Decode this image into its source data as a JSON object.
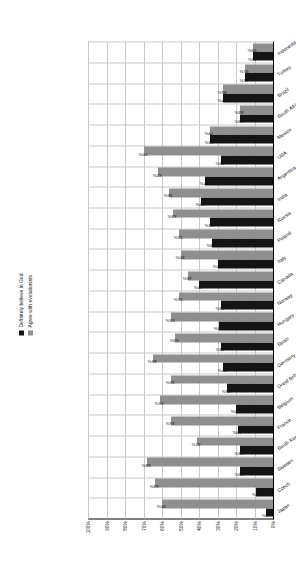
{
  "chart_data": {
    "type": "bar",
    "title": "",
    "xlabel": "",
    "ylabel": "",
    "ylim": [
      0,
      100
    ],
    "ytick_labels": [
      "100%",
      "90%",
      "80%",
      "70%",
      "60%",
      "50%",
      "40%",
      "30%",
      "20%",
      "10%",
      "0%"
    ],
    "ytick_values": [
      100,
      90,
      80,
      70,
      60,
      50,
      40,
      30,
      20,
      10,
      0
    ],
    "grid": true,
    "legend_position": "top-right",
    "categories": [
      "Japan",
      "Czech",
      "Sweden",
      "South Korea",
      "France",
      "Belgium",
      "Great Britain",
      "Germany",
      "Spain",
      "Hungary",
      "Norway",
      "Canada",
      "Italy",
      "Poland",
      "Russia",
      "India",
      "Argentina",
      "USA",
      "Mexico",
      "South Africa",
      "Brazil",
      "Turkey",
      "Indonesia"
    ],
    "series": [
      {
        "name": "Definitely believe in God",
        "color": "#141414",
        "values": [
          4,
          9,
          18,
          18,
          19,
          20,
          25,
          27,
          28,
          29,
          28,
          40,
          30,
          33,
          34,
          39,
          37,
          28,
          34,
          18,
          27,
          15,
          11
        ]
      },
      {
        "name": "Agree with evolutionists",
        "color": "#8f8f8f",
        "values": [
          60,
          64,
          68,
          41,
          55,
          61,
          55,
          65,
          53,
          55,
          51,
          46,
          50,
          51,
          54,
          56,
          62,
          70,
          34,
          18,
          27,
          15,
          11
        ]
      }
    ]
  },
  "legend": {
    "items": [
      {
        "label": "Definitely believe in God",
        "swatch": "dark-square-icon"
      },
      {
        "label": "Agree with evolutionists",
        "swatch": "light-square-icon"
      }
    ]
  },
  "bar_labels": {
    "dark": [
      "4%",
      "9%",
      "18%",
      "18%",
      "19%",
      "20%",
      "25%",
      "27%",
      "28%",
      "29%",
      "28%",
      "40%",
      "30%",
      "33%",
      "34%",
      "39%",
      "37%",
      "28%",
      "34%",
      "18%",
      "27%",
      "15%",
      "11%"
    ],
    "light": [
      "60%",
      "64%",
      "68%",
      "41%",
      "55%",
      "61%",
      "55%",
      "65%",
      "53%",
      "55%",
      "51%",
      "46%",
      "50%",
      "51%",
      "54%",
      "56%",
      "62%",
      "70%",
      "79%",
      "84%",
      "85%",
      "91%",
      "93%"
    ]
  }
}
